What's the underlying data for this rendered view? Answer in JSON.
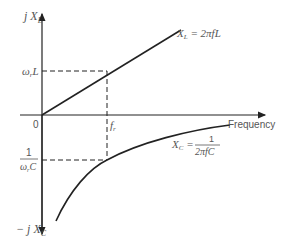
{
  "diagram": {
    "type": "reactance-vs-frequency",
    "y_axis_top_label": "j X",
    "y_axis_top_sub": "L",
    "y_axis_bottom_label": "− j X",
    "y_axis_bottom_sub": "C",
    "x_axis_label": "Frequency",
    "origin_label": "0",
    "resonant_freq_label": "f",
    "resonant_freq_sub": "r",
    "xl_level_label": "ω",
    "xl_level_sub": "r",
    "xl_level_suffix": "L",
    "xc_level_num": "1",
    "xc_level_den": "ω",
    "xc_level_den_sub": "r",
    "xc_level_den_suffix": "C",
    "xl_curve_label": "X",
    "xl_curve_sub": "L",
    "xl_curve_eq": " = 2πfL",
    "xc_curve_label": "X",
    "xc_curve_sub": "C",
    "xc_curve_eq": " = ",
    "xc_curve_num": "1",
    "xc_curve_den": "2πfC",
    "colors": {
      "line": "#222222",
      "text": "#555555"
    }
  }
}
